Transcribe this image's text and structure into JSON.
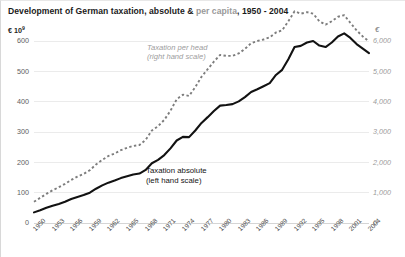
{
  "title": {
    "part1": "Development of German taxation, absolute & ",
    "muted": "per capita",
    "part2": ", 1950 - 2004"
  },
  "axis": {
    "left_label": "€ 10",
    "left_exponent": "9",
    "right_label": "€"
  },
  "annotations": {
    "per_head_line1": "Taxation per head",
    "per_head_line2": "(right hand scale)",
    "absolute_line1": "Taxation absolute",
    "absolute_line2": "(left hand scale)"
  },
  "colors": {
    "absolute": "#121212",
    "per_head": "#7d7d7d",
    "grid": "#ebebeb",
    "title": "#1b1b1b",
    "title_muted": "#9a9a9a"
  },
  "chart_data": {
    "type": "line",
    "title": "Development of German taxation, absolute & per capita, 1950 - 2004",
    "xlabel": "",
    "ylabel": "€ 10^9",
    "y2label": "€",
    "ylim": [
      0,
      600
    ],
    "y2lim": [
      0,
      6000
    ],
    "yticks": [
      0,
      100,
      200,
      300,
      400,
      500,
      600
    ],
    "yticklabels": [
      "0",
      "100",
      "200",
      "300",
      "400",
      "500",
      "600"
    ],
    "y2ticks": [
      0,
      1000,
      2000,
      3000,
      4000,
      5000,
      6000
    ],
    "y2ticklabels": [
      "0",
      "1,000",
      "2,000",
      "3,000",
      "4,000",
      "5,000",
      "6,000"
    ],
    "xticklabels": [
      "1950",
      "1953",
      "1956",
      "1959",
      "1962",
      "1965",
      "1968",
      "1971",
      "1974",
      "1977",
      "1980",
      "1983",
      "1986",
      "1989",
      "1992",
      "1995",
      "1998",
      "2001",
      "2004"
    ],
    "xtick_rotation": -45,
    "xlim": [
      1950,
      2004
    ],
    "grid": "horizontal",
    "legend": "inline-annotations",
    "x": [
      1950,
      1951,
      1952,
      1953,
      1954,
      1955,
      1956,
      1957,
      1958,
      1959,
      1960,
      1961,
      1962,
      1963,
      1964,
      1965,
      1966,
      1967,
      1968,
      1969,
      1970,
      1971,
      1972,
      1973,
      1974,
      1975,
      1976,
      1977,
      1978,
      1979,
      1980,
      1981,
      1982,
      1983,
      1984,
      1985,
      1986,
      1987,
      1988,
      1989,
      1990,
      1991,
      1992,
      1993,
      1994,
      1995,
      1996,
      1997,
      1998,
      1999,
      2000,
      2001,
      2002,
      2003,
      2004
    ],
    "series": [
      {
        "name": "Taxation absolute",
        "axis": "left",
        "units": "€ 10^9",
        "style": "solid",
        "values": [
          35,
          42,
          50,
          57,
          63,
          70,
          79,
          86,
          92,
          100,
          113,
          124,
          133,
          140,
          148,
          154,
          160,
          163,
          175,
          197,
          208,
          224,
          246,
          272,
          284,
          283,
          305,
          330,
          349,
          369,
          387,
          389,
          392,
          401,
          415,
          432,
          441,
          451,
          461,
          488,
          505,
          540,
          580,
          584,
          595,
          600,
          585,
          580,
          595,
          615,
          625,
          610,
          590,
          575,
          560
        ]
      },
      {
        "name": "Taxation per head",
        "axis": "right",
        "units": "€",
        "style": "dashed",
        "values": [
          700,
          830,
          960,
          1080,
          1180,
          1290,
          1420,
          1530,
          1620,
          1740,
          1930,
          2080,
          2210,
          2290,
          2400,
          2480,
          2540,
          2570,
          2740,
          3050,
          3190,
          3400,
          3700,
          4080,
          4230,
          4190,
          4480,
          4820,
          5070,
          5320,
          5540,
          5510,
          5510,
          5590,
          5740,
          5930,
          6000,
          6050,
          6120,
          6280,
          6350,
          6650,
          6980,
          6900,
          6950,
          6900,
          6650,
          6540,
          6650,
          6800,
          6850,
          6600,
          6350,
          6150,
          5980
        ]
      }
    ]
  }
}
